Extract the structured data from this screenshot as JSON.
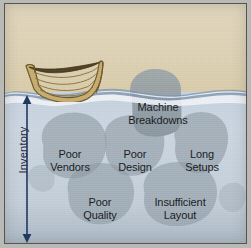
{
  "figure": {
    "background_color": "#ded2b6",
    "water_color": "#c8d4e0",
    "rock_color": "#8e9aa2"
  },
  "axis_label": {
    "name": "inventory-label",
    "text": "Inventory",
    "color": "#14243f",
    "orientation": "vertical-double-arrow"
  },
  "boat": {
    "name": "boat",
    "hull_color": "#c0a868",
    "plank_outline_color": "#6d5a2c",
    "interior_color": "#5d4a22"
  },
  "rocks": [
    {
      "name": "rock-machine-breakdowns",
      "label": "Machine\nBreakdowns",
      "above_water": true
    },
    {
      "name": "rock-poor-vendors",
      "label": "Poor\nVendors",
      "above_water": false
    },
    {
      "name": "rock-poor-design",
      "label": "Poor\nDesign",
      "above_water": false
    },
    {
      "name": "rock-long-setups",
      "label": "Long\nSetups",
      "above_water": false
    },
    {
      "name": "rock-poor-quality",
      "label": "Poor\nQuality",
      "above_water": false
    },
    {
      "name": "rock-insufficient-layout",
      "label": "Insufficient\nLayout",
      "above_water": false
    }
  ]
}
